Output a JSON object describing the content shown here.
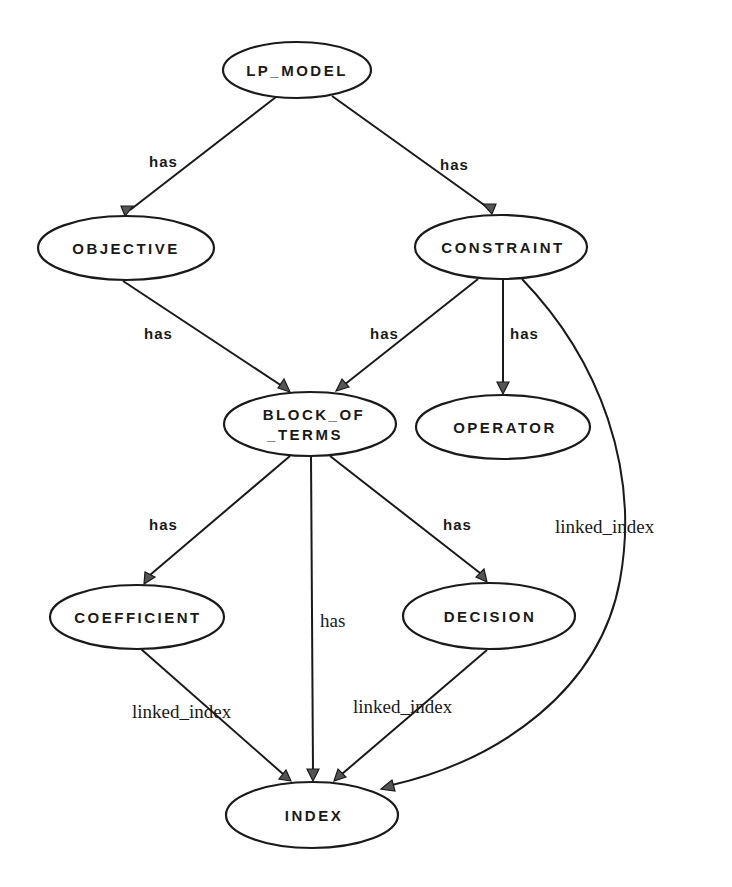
{
  "diagram": {
    "nodes": {
      "lp_model": {
        "label": "LP_MODEL",
        "cx": 297,
        "cy": 70,
        "rx": 74,
        "ry": 28
      },
      "objective": {
        "label": "OBJECTIVE",
        "cx": 126,
        "cy": 248,
        "rx": 88,
        "ry": 32
      },
      "constraint": {
        "label": "CONSTRAINT",
        "cx": 501,
        "cy": 247,
        "rx": 86,
        "ry": 32
      },
      "block_of_terms": {
        "label_line1": "BLOCK_OF",
        "label_line2": "_TERMS",
        "cx": 310,
        "cy": 424,
        "rx": 86,
        "ry": 32
      },
      "operator": {
        "label": "OPERATOR",
        "cx": 503,
        "cy": 427,
        "rx": 87,
        "ry": 32
      },
      "coefficient": {
        "label": "COEFFICIENT",
        "cx": 137,
        "cy": 617,
        "rx": 87,
        "ry": 32
      },
      "decision": {
        "label": "DECISION",
        "cx": 489,
        "cy": 616,
        "rx": 86,
        "ry": 33
      },
      "index": {
        "label": "INDEX",
        "cx": 312,
        "cy": 815,
        "rx": 86,
        "ry": 33
      }
    },
    "edges": [
      {
        "from": "LP_MODEL",
        "to": "OBJECTIVE",
        "label": "has"
      },
      {
        "from": "LP_MODEL",
        "to": "CONSTRAINT",
        "label": "has"
      },
      {
        "from": "OBJECTIVE",
        "to": "BLOCK_OF_TERMS",
        "label": "has"
      },
      {
        "from": "CONSTRAINT",
        "to": "BLOCK_OF_TERMS",
        "label": "has"
      },
      {
        "from": "CONSTRAINT",
        "to": "OPERATOR",
        "label": "has"
      },
      {
        "from": "CONSTRAINT",
        "to": "INDEX",
        "label": "linked_index"
      },
      {
        "from": "BLOCK_OF_TERMS",
        "to": "COEFFICIENT",
        "label": "has"
      },
      {
        "from": "BLOCK_OF_TERMS",
        "to": "INDEX",
        "label": "has"
      },
      {
        "from": "BLOCK_OF_TERMS",
        "to": "DECISION",
        "label": "has"
      },
      {
        "from": "COEFFICIENT",
        "to": "INDEX",
        "label": "linked_index"
      },
      {
        "from": "DECISION",
        "to": "INDEX",
        "label": "linked_index"
      }
    ],
    "edge_labels": {
      "lp_obj": "has",
      "lp_con": "has",
      "obj_bot": "has",
      "con_bot": "has",
      "con_op": "has",
      "con_idx": "linked_index",
      "bot_coef": "has",
      "bot_idx": "has",
      "bot_dec": "has",
      "coef_idx": "linked_index",
      "dec_idx": "linked_index"
    },
    "colors": {
      "stroke": "#1a1a1a",
      "arrow_fill": "#555555",
      "background": "#ffffff"
    }
  }
}
